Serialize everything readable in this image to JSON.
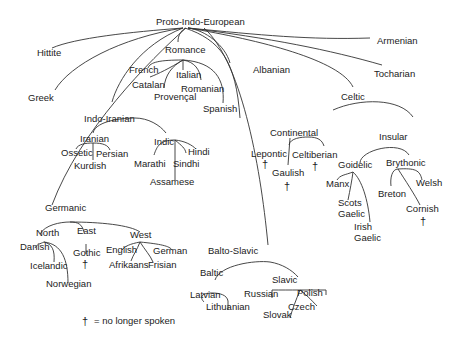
{
  "root": "Proto-Indo-European",
  "colors": {
    "line": "#333333",
    "text": "#222222",
    "background": "#ffffff"
  },
  "legend": {
    "symbol": "†",
    "text": "= no longer spoken"
  },
  "nodes": {
    "pie": "Proto-Indo-European",
    "hittite": "Hittite",
    "greek": "Greek",
    "romance": "Romance",
    "french": "French",
    "catalan": "Catalan",
    "italian": "Italian",
    "romanian": "Romanian",
    "provencal": "Provençal",
    "spanish": "Spanish",
    "albanian": "Albanian",
    "armenian": "Armenian",
    "tocharian": "Tocharian",
    "celtic": "Celtic",
    "continental": "Continental",
    "lepontic": "Lepontic",
    "celtiberian": "Celtiberian",
    "gaulish": "Gaulish",
    "insular": "Insular",
    "goidelic": "Goidelic",
    "brythonic": "Brythonic",
    "manx": "Manx",
    "scots_gaelic_1": "Scots",
    "scots_gaelic_2": "Gaelic",
    "irish_gaelic_1": "Irish",
    "irish_gaelic_2": "Gaelic",
    "breton": "Breton",
    "welsh": "Welsh",
    "cornish": "Cornish",
    "indo_iranian": "Indo-Iranian",
    "iranian": "Iranian",
    "ossetic": "Ossetic",
    "persian": "Persian",
    "kurdish": "Kurdish",
    "indic": "Indic",
    "hindi": "Hindi",
    "marathi": "Marathi",
    "sindhi": "Sindhi",
    "assamese": "Assamese",
    "germanic": "Germanic",
    "north": "North",
    "east": "East",
    "west": "West",
    "danish": "Danish",
    "icelandic": "Icelandic",
    "norwegian": "Norwegian",
    "gothic": "Gothic",
    "english": "English",
    "afrikaans": "Afrikaans",
    "frisian": "Frisian",
    "german": "German",
    "balto_slavic": "Balto-Slavic",
    "baltic": "Baltic",
    "latvian": "Latvian",
    "lithuanian": "Lithuanian",
    "slavic": "Slavic",
    "russian": "Russian",
    "polish": "Polish",
    "czech": "Czech",
    "slovak": "Slovak"
  },
  "extinct_marker": "†",
  "extinct": [
    "Lepontic",
    "Celtiberian",
    "Gaulish",
    "Cornish",
    "Gothic"
  ]
}
